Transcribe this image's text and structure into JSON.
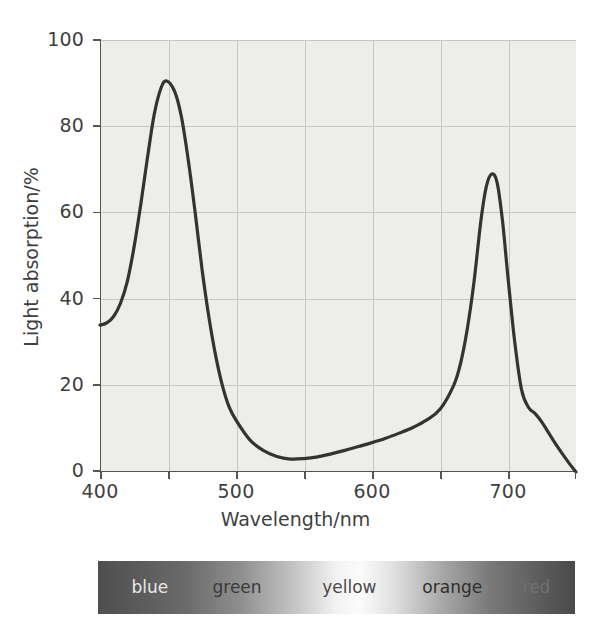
{
  "figure": {
    "background_color": "#ffffff",
    "plot_background_color": "#ededea",
    "grid_color": "#c6c6c6",
    "axis_color": "#555555",
    "curve_color": "#333333"
  },
  "axes": {
    "x_title": "Wavelength/nm",
    "y_title": "Light absorption/%",
    "x_ticks": [
      "400",
      "500",
      "600",
      "700"
    ],
    "y_ticks": [
      "100",
      "80",
      "60",
      "40",
      "20",
      "0"
    ]
  },
  "spectrum": {
    "labels": [
      {
        "text": "blue",
        "left_pct": 7,
        "color": "#e8e8e8"
      },
      {
        "text": "green",
        "left_pct": 24,
        "color": "#3a3a3a"
      },
      {
        "text": "yellow",
        "left_pct": 47,
        "color": "#4a4a4a"
      },
      {
        "text": "orange",
        "left_pct": 68,
        "color": "#2f2f2f"
      },
      {
        "text": "red",
        "left_pct": 89,
        "color": "#707070"
      }
    ],
    "gradient_stops": [
      {
        "pos": 0,
        "color": "#4f4f4f"
      },
      {
        "pos": 8,
        "color": "#5a5a5a"
      },
      {
        "pos": 18,
        "color": "#6a6a6a"
      },
      {
        "pos": 30,
        "color": "#8f8f8f"
      },
      {
        "pos": 42,
        "color": "#c8c8c8"
      },
      {
        "pos": 50,
        "color": "#f3f3f3"
      },
      {
        "pos": 55,
        "color": "#fbfbfb"
      },
      {
        "pos": 62,
        "color": "#e0e0e0"
      },
      {
        "pos": 72,
        "color": "#a8a8a8"
      },
      {
        "pos": 82,
        "color": "#7a7a7a"
      },
      {
        "pos": 92,
        "color": "#5e5e5e"
      },
      {
        "pos": 100,
        "color": "#4a4a4a"
      }
    ]
  },
  "chart_data": {
    "type": "line",
    "title": "",
    "xlabel": "Wavelength/nm",
    "ylabel": "Light absorption/%",
    "xlim": [
      400,
      750
    ],
    "ylim": [
      0,
      100
    ],
    "xtick_values": [
      400,
      500,
      600,
      700
    ],
    "ytick_values": [
      0,
      20,
      40,
      60,
      80,
      100
    ],
    "grid": true,
    "grid_x_values": [
      450,
      500,
      550,
      600,
      650,
      700,
      750
    ],
    "grid_y_values": [
      20,
      40,
      60,
      80,
      100
    ],
    "legend": null,
    "series": [
      {
        "name": "Chlorophyll absorption spectrum",
        "x": [
          400,
          405,
          410,
          415,
          420,
          425,
          430,
          435,
          440,
          445,
          449,
          455,
          460,
          465,
          470,
          475,
          480,
          485,
          490,
          495,
          500,
          510,
          520,
          530,
          540,
          550,
          560,
          570,
          580,
          590,
          600,
          610,
          620,
          630,
          640,
          650,
          660,
          665,
          670,
          675,
          680,
          684,
          688,
          692,
          696,
          700,
          705,
          710,
          715,
          720,
          725,
          730,
          735,
          740,
          745,
          750
        ],
        "y": [
          34,
          34.5,
          36,
          39,
          44,
          52,
          62,
          73,
          83,
          89,
          90.5,
          88,
          82,
          72,
          60,
          47,
          36,
          27,
          20,
          15,
          12,
          7.5,
          5,
          3.6,
          3.0,
          3.1,
          3.5,
          4.2,
          5.0,
          5.9,
          6.8,
          7.8,
          9.0,
          10.3,
          12.0,
          14.5,
          20.0,
          25.0,
          33.0,
          44.0,
          58.0,
          66.0,
          69.0,
          67.0,
          58.0,
          45.0,
          30.0,
          19.0,
          15.0,
          13.5,
          11.5,
          9.0,
          6.5,
          4.2,
          2.0,
          0.0
        ]
      }
    ],
    "annotations": {
      "peak_blue": {
        "x": 449,
        "y": 90.5
      },
      "minimum_green": {
        "x": 540,
        "y": 3.0
      },
      "peak_red": {
        "x": 688,
        "y": 69.0
      }
    },
    "spectrum_bands": [
      "blue",
      "green",
      "yellow",
      "orange",
      "red"
    ]
  }
}
